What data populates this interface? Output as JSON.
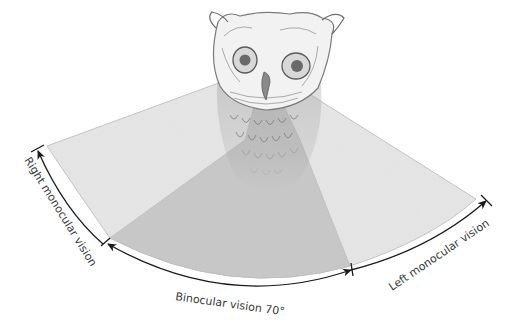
{
  "figure": {
    "labels": {
      "right_monocular": "Right monocular vision",
      "binocular": "Binocular vision 70°",
      "left_monocular": "Left monocular vision"
    },
    "binocular_angle_deg": 70
  },
  "colors": {
    "background": "#ffffff",
    "monocular_fill": "#e6e6e6",
    "binocular_fill": "#c8c8c8",
    "fan_edge": "#c4c4c4",
    "arrow": "#1a1a1a",
    "label_text": "#3a3a3a",
    "owl_ink": "#6a6a6a"
  }
}
